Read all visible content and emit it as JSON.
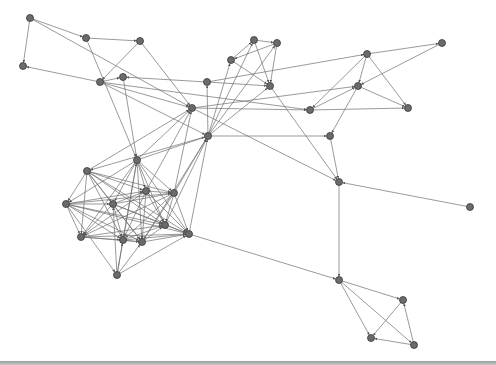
{
  "diagram": {
    "type": "directed-network-graph",
    "edge_color": "#6e6e6e",
    "node_color": "#6b6b6b",
    "nodes": [
      {
        "id": "n0",
        "x": 30,
        "y": 18
      },
      {
        "id": "n1",
        "x": 86,
        "y": 38
      },
      {
        "id": "n2",
        "x": 140,
        "y": 41
      },
      {
        "id": "n3",
        "x": 23,
        "y": 66
      },
      {
        "id": "n4",
        "x": 100,
        "y": 82
      },
      {
        "id": "n5",
        "x": 123,
        "y": 77
      },
      {
        "id": "n6",
        "x": 192,
        "y": 108
      },
      {
        "id": "n7",
        "x": 207,
        "y": 82
      },
      {
        "id": "n8",
        "x": 231,
        "y": 60
      },
      {
        "id": "n9",
        "x": 254,
        "y": 40
      },
      {
        "id": "n10",
        "x": 277,
        "y": 43
      },
      {
        "id": "n11",
        "x": 270,
        "y": 86
      },
      {
        "id": "n12",
        "x": 208,
        "y": 136
      },
      {
        "id": "n13",
        "x": 137,
        "y": 160
      },
      {
        "id": "n14",
        "x": 87,
        "y": 171
      },
      {
        "id": "n15",
        "x": 310,
        "y": 110
      },
      {
        "id": "n16",
        "x": 367,
        "y": 54
      },
      {
        "id": "n17",
        "x": 442,
        "y": 43
      },
      {
        "id": "n18",
        "x": 358,
        "y": 86
      },
      {
        "id": "n19",
        "x": 408,
        "y": 108
      },
      {
        "id": "n20",
        "x": 330,
        "y": 136
      },
      {
        "id": "n21",
        "x": 339,
        "y": 182
      },
      {
        "id": "n22",
        "x": 470,
        "y": 207
      },
      {
        "id": "n23",
        "x": 66,
        "y": 204
      },
      {
        "id": "n24",
        "x": 113,
        "y": 204
      },
      {
        "id": "n25",
        "x": 146,
        "y": 191
      },
      {
        "id": "n26",
        "x": 174,
        "y": 193
      },
      {
        "id": "n27",
        "x": 81,
        "y": 237
      },
      {
        "id": "n28",
        "x": 123,
        "y": 240
      },
      {
        "id": "n29",
        "x": 142,
        "y": 242
      },
      {
        "id": "n30",
        "x": 165,
        "y": 225
      },
      {
        "id": "n31",
        "x": 189,
        "y": 234
      },
      {
        "id": "n32",
        "x": 117,
        "y": 275
      },
      {
        "id": "n33",
        "x": 339,
        "y": 280
      },
      {
        "id": "n34",
        "x": 403,
        "y": 300
      },
      {
        "id": "n35",
        "x": 371,
        "y": 338
      },
      {
        "id": "n36",
        "x": 414,
        "y": 345
      }
    ],
    "edges": [
      [
        "n0",
        "n1"
      ],
      [
        "n0",
        "n3"
      ],
      [
        "n0",
        "n6"
      ],
      [
        "n4",
        "n3"
      ],
      [
        "n1",
        "n13"
      ],
      [
        "n2",
        "n4"
      ],
      [
        "n2",
        "n6"
      ],
      [
        "n4",
        "n6"
      ],
      [
        "n4",
        "n12"
      ],
      [
        "n5",
        "n13"
      ],
      [
        "n7",
        "n5"
      ],
      [
        "n4",
        "n5"
      ],
      [
        "n14",
        "n6"
      ],
      [
        "n13",
        "n6"
      ],
      [
        "n13",
        "n12"
      ],
      [
        "n12",
        "n7"
      ],
      [
        "n12",
        "n8"
      ],
      [
        "n12",
        "n9"
      ],
      [
        "n12",
        "n10"
      ],
      [
        "n8",
        "n9"
      ],
      [
        "n9",
        "n10"
      ],
      [
        "n10",
        "n8"
      ],
      [
        "n8",
        "n11"
      ],
      [
        "n9",
        "n11"
      ],
      [
        "n10",
        "n11"
      ],
      [
        "n4",
        "n15"
      ],
      [
        "n7",
        "n16"
      ],
      [
        "n16",
        "n17"
      ],
      [
        "n17",
        "n18"
      ],
      [
        "n16",
        "n18"
      ],
      [
        "n16",
        "n19"
      ],
      [
        "n18",
        "n19"
      ],
      [
        "n15",
        "n18"
      ],
      [
        "n16",
        "n15"
      ],
      [
        "n6",
        "n15"
      ],
      [
        "n11",
        "n21"
      ],
      [
        "n12",
        "n20"
      ],
      [
        "n18",
        "n20"
      ],
      [
        "n6",
        "n18"
      ],
      [
        "n6",
        "n21"
      ],
      [
        "n20",
        "n21"
      ],
      [
        "n22",
        "n21"
      ],
      [
        "n21",
        "n33"
      ],
      [
        "n31",
        "n33"
      ],
      [
        "n33",
        "n34"
      ],
      [
        "n33",
        "n35"
      ],
      [
        "n33",
        "n36"
      ],
      [
        "n34",
        "n35"
      ],
      [
        "n36",
        "n34"
      ],
      [
        "n36",
        "n35"
      ],
      [
        "n15",
        "n19"
      ],
      [
        "n12",
        "n14"
      ],
      [
        "n14",
        "n23"
      ],
      [
        "n14",
        "n24"
      ],
      [
        "n14",
        "n25"
      ],
      [
        "n14",
        "n26"
      ],
      [
        "n14",
        "n27"
      ],
      [
        "n14",
        "n28"
      ],
      [
        "n14",
        "n29"
      ],
      [
        "n14",
        "n30"
      ],
      [
        "n14",
        "n31"
      ],
      [
        "n13",
        "n23"
      ],
      [
        "n13",
        "n24"
      ],
      [
        "n13",
        "n25"
      ],
      [
        "n13",
        "n26"
      ],
      [
        "n13",
        "n27"
      ],
      [
        "n13",
        "n28"
      ],
      [
        "n13",
        "n29"
      ],
      [
        "n13",
        "n30"
      ],
      [
        "n13",
        "n31"
      ],
      [
        "n23",
        "n24"
      ],
      [
        "n23",
        "n25"
      ],
      [
        "n23",
        "n26"
      ],
      [
        "n23",
        "n27"
      ],
      [
        "n23",
        "n28"
      ],
      [
        "n23",
        "n29"
      ],
      [
        "n23",
        "n30"
      ],
      [
        "n23",
        "n31"
      ],
      [
        "n23",
        "n32"
      ],
      [
        "n24",
        "n25"
      ],
      [
        "n24",
        "n26"
      ],
      [
        "n24",
        "n27"
      ],
      [
        "n24",
        "n28"
      ],
      [
        "n24",
        "n29"
      ],
      [
        "n24",
        "n30"
      ],
      [
        "n24",
        "n31"
      ],
      [
        "n25",
        "n26"
      ],
      [
        "n25",
        "n27"
      ],
      [
        "n25",
        "n28"
      ],
      [
        "n25",
        "n29"
      ],
      [
        "n25",
        "n30"
      ],
      [
        "n25",
        "n31"
      ],
      [
        "n26",
        "n27"
      ],
      [
        "n26",
        "n28"
      ],
      [
        "n26",
        "n29"
      ],
      [
        "n26",
        "n30"
      ],
      [
        "n26",
        "n31"
      ],
      [
        "n27",
        "n28"
      ],
      [
        "n27",
        "n29"
      ],
      [
        "n27",
        "n30"
      ],
      [
        "n27",
        "n31"
      ],
      [
        "n28",
        "n29"
      ],
      [
        "n28",
        "n30"
      ],
      [
        "n28",
        "n31"
      ],
      [
        "n29",
        "n30"
      ],
      [
        "n29",
        "n31"
      ],
      [
        "n30",
        "n31"
      ],
      [
        "n32",
        "n28"
      ],
      [
        "n32",
        "n29"
      ],
      [
        "n32",
        "n31"
      ],
      [
        "n32",
        "n24"
      ],
      [
        "n32",
        "n13"
      ],
      [
        "n26",
        "n12"
      ],
      [
        "n30",
        "n12"
      ],
      [
        "n31",
        "n12"
      ],
      [
        "n29",
        "n12"
      ],
      [
        "n25",
        "n6"
      ],
      [
        "n26",
        "n6"
      ],
      [
        "n7",
        "n11"
      ],
      [
        "n12",
        "n11"
      ],
      [
        "n1",
        "n2"
      ]
    ]
  }
}
